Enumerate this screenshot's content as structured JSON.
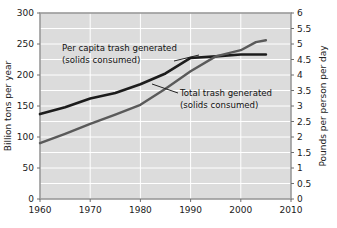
{
  "figure": {
    "background_color": "#ffffff",
    "plot_background_color": "#dcdcdc",
    "grid_color": "#ffffff",
    "frame_color": "#9a9a9a"
  },
  "chart_data": {
    "type": "line",
    "title": "",
    "xlabel": "",
    "ylabel": "Billion tons per year",
    "y2label": "Pounds per person per day",
    "xlim": [
      1960,
      2010
    ],
    "ylim": [
      0,
      300
    ],
    "y2lim": [
      0,
      6
    ],
    "grid": true,
    "legend": "annotations-on-plot",
    "xticks": [
      1960,
      1970,
      1980,
      1990,
      2000,
      2010
    ],
    "xticklabels": [
      "1960",
      "1970",
      "1980",
      "1990",
      "2000",
      "2010"
    ],
    "yticks": [
      0,
      50,
      100,
      150,
      200,
      250,
      300
    ],
    "yticklabels": [
      "0",
      "50",
      "100",
      "150",
      "200",
      "250",
      "300"
    ],
    "y2ticks": [
      0,
      0.5,
      1,
      1.5,
      2,
      2.5,
      3,
      3.5,
      4,
      4.5,
      5,
      5.5,
      6
    ],
    "y2ticklabels": [
      "0",
      "0.5",
      "1",
      "1.5",
      "2",
      "2.5",
      "3",
      "3.5",
      "4",
      "4.5",
      "5",
      "5.5",
      "6"
    ],
    "gridlines_y": [
      0,
      25,
      50,
      75,
      100,
      125,
      150,
      175,
      200,
      225,
      250,
      275,
      300
    ],
    "gridlines_x": [
      1970,
      1980,
      1990,
      2000
    ],
    "series": [
      {
        "name": "Per capita trash generated (solids consumed)",
        "axis": "right",
        "color": "#1c1c1c",
        "line_width": 2.6,
        "x": [
          1960,
          1965,
          1970,
          1975,
          1980,
          1985,
          1990,
          1995,
          2000,
          2005
        ],
        "values": [
          2.74,
          2.96,
          3.24,
          3.42,
          3.7,
          4.05,
          4.55,
          4.6,
          4.66,
          4.66
        ],
        "values_left_scale": [
          137,
          148,
          162,
          171,
          185,
          203,
          228,
          230,
          233,
          233
        ]
      },
      {
        "name": "Total trash generated (solids consumed)",
        "axis": "left",
        "color": "#5a5a5a",
        "line_width": 2.4,
        "x": [
          1960,
          1965,
          1970,
          1975,
          1980,
          1985,
          1990,
          1995,
          2000,
          2003,
          2005
        ],
        "values": [
          90,
          105,
          121,
          136,
          152,
          178,
          206,
          230,
          240,
          253,
          256
        ],
        "values_right_scale": [
          1.8,
          2.1,
          2.42,
          2.72,
          3.04,
          3.56,
          4.12,
          4.6,
          4.8,
          5.06,
          5.12
        ]
      }
    ],
    "annotations": [
      {
        "id": "per-capita-annotation",
        "line1": "Per capita trash generated",
        "line2": "(solids consumed)",
        "leader_from": [
          176,
          65
        ],
        "leader_to": [
          199,
          56
        ]
      },
      {
        "id": "total-trash-annotation",
        "line1": "Total trash generated",
        "line2": "(solids consumed)",
        "leader_from": [
          176,
          99
        ],
        "leader_to": [
          152,
          88
        ]
      }
    ]
  }
}
